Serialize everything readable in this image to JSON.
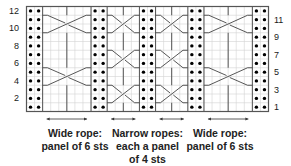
{
  "chart": {
    "columns": 30,
    "rows": 12,
    "left_row_labels": [
      2,
      4,
      6,
      8,
      10,
      12
    ],
    "right_row_labels": [
      1,
      3,
      5,
      7,
      9,
      11
    ],
    "colors": {
      "grid": "#d4d4d4",
      "border": "#555555",
      "cable_line": "#444444",
      "purl_dot": "#000000",
      "background": "#ffffff"
    },
    "panels": [
      {
        "type": "purl",
        "start_col": 0,
        "width": 2
      },
      {
        "type": "cable",
        "name": "wide-rope-left",
        "start_col": 2,
        "width": 6,
        "cross_rows": [
          4,
          10
        ]
      },
      {
        "type": "purl",
        "start_col": 8,
        "width": 2
      },
      {
        "type": "cable",
        "name": "narrow-rope-1",
        "start_col": 10,
        "width": 4,
        "cross_rows": [
          2,
          6,
          10
        ]
      },
      {
        "type": "purl",
        "start_col": 14,
        "width": 2
      },
      {
        "type": "cable",
        "name": "narrow-rope-2",
        "start_col": 16,
        "width": 4,
        "cross_rows": [
          2,
          6,
          10
        ]
      },
      {
        "type": "purl",
        "start_col": 20,
        "width": 2
      },
      {
        "type": "cable",
        "name": "wide-rope-right",
        "start_col": 22,
        "width": 6,
        "cross_rows": [
          4,
          10
        ]
      },
      {
        "type": "purl",
        "start_col": 28,
        "width": 2
      }
    ]
  },
  "captions": {
    "wide_left": {
      "line1": "Wide rope:",
      "line2": "panel of 6 sts"
    },
    "narrow": {
      "line1": "Narrow ropes:",
      "line2": "each a panel",
      "line3": "of 4 sts"
    },
    "wide_right": {
      "line1": "Wide rope:",
      "line2": "panel of 6 sts"
    }
  }
}
